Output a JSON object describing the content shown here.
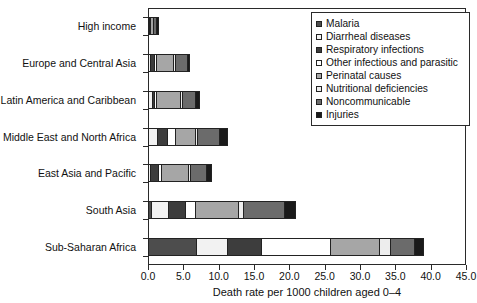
{
  "chart_data": {
    "type": "bar",
    "orientation": "horizontal",
    "stacked": true,
    "title": "",
    "xlabel": "Death rate per 1000 children aged 0–4",
    "ylabel": "",
    "xlim": [
      0.0,
      45.0
    ],
    "xticks": [
      "0.0",
      "5.0",
      "10.0",
      "15.0",
      "20.0",
      "25.0",
      "30.0",
      "35.0",
      "40.0",
      "45.0"
    ],
    "xtick_values": [
      0,
      5,
      10,
      15,
      20,
      25,
      30,
      35,
      40,
      45
    ],
    "grid": false,
    "legend_position": "top-right",
    "categories": [
      "High income",
      "Europe and Central Asia",
      "Latin America and Caribbean",
      "Middle East and North Africa",
      "East Asia and Pacific",
      "South Asia",
      "Sub-Saharan Africa"
    ],
    "series": [
      {
        "name": "Malaria",
        "color": "#4d4d4d",
        "values": [
          0.0,
          0.0,
          0.0,
          0.0,
          0.0,
          0.4,
          6.8
        ]
      },
      {
        "name": "Diarrheal diseases",
        "color": "#f2f2f2",
        "values": [
          0.0,
          0.3,
          0.5,
          1.3,
          0.3,
          2.5,
          4.4
        ]
      },
      {
        "name": "Respiratory infections",
        "color": "#3d3d3d",
        "values": [
          0.1,
          0.6,
          0.3,
          1.4,
          1.1,
          2.4,
          4.8
        ]
      },
      {
        "name": "Other infectious and parasitic",
        "color": "#ffffff",
        "values": [
          0.1,
          0.3,
          0.4,
          1.1,
          0.4,
          1.3,
          9.7
        ]
      },
      {
        "name": "Perinatal causes",
        "color": "#a6a6a6",
        "values": [
          0.4,
          2.4,
          3.4,
          2.9,
          3.9,
          6.2,
          7.0
        ]
      },
      {
        "name": "Nutritional deficiencies",
        "color": "#ededed",
        "values": [
          0.0,
          0.2,
          0.2,
          0.3,
          0.2,
          0.6,
          1.5
        ]
      },
      {
        "name": "Noncommunicable",
        "color": "#6b6b6b",
        "values": [
          0.5,
          1.7,
          1.9,
          3.1,
          2.3,
          5.9,
          3.5
        ]
      },
      {
        "name": "Injuries",
        "color": "#1a1a1a",
        "values": [
          0.4,
          0.5,
          0.6,
          1.2,
          0.8,
          1.7,
          1.3
        ]
      }
    ],
    "totals": [
      1.5,
      6.0,
      7.3,
      11.3,
      9.0,
      21.0,
      39.0
    ]
  },
  "legend": {
    "items": [
      {
        "label": "Malaria"
      },
      {
        "label": "Diarrheal diseases"
      },
      {
        "label": "Respiratory infections"
      },
      {
        "label": "Other infectious and parasitic"
      },
      {
        "label": "Perinatal causes"
      },
      {
        "label": "Nutritional deficiencies"
      },
      {
        "label": "Noncommunicable"
      },
      {
        "label": "Injuries"
      }
    ]
  }
}
